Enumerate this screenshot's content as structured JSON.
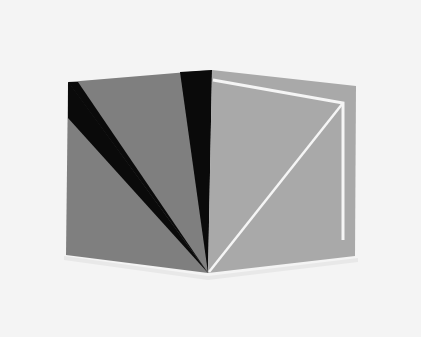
{
  "image": {
    "description": "Abstract geometric artwork: two grey panels forming an open-book/cube shape with black wedges and white lines",
    "background": "#f4f4f4",
    "colors": {
      "left_panel": "#7f7f7f",
      "right_panel": "#a9a9a9",
      "black_wedge": "#0a0a0a",
      "white_line": "#f5f5f5"
    }
  }
}
